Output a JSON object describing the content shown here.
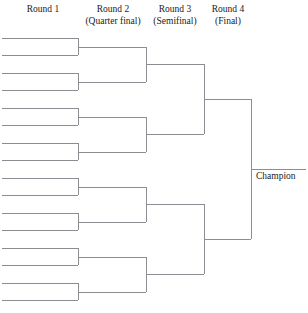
{
  "diagram": {
    "type": "tournament-bracket",
    "teams": 16,
    "rounds": 4,
    "line_color": "#8c8c92",
    "text_color": "#1a1a1a",
    "background_color": "#ffffff"
  },
  "headers": [
    {
      "id": "round-1",
      "line1": "Round 1",
      "line2": "",
      "center_x": 43,
      "top": 4
    },
    {
      "id": "round-2",
      "line1": "Round 2",
      "line2": "(Quarter final)",
      "center_x": 113,
      "top": 4
    },
    {
      "id": "round-3",
      "line1": "Round 3",
      "line2": "(Semifinal)",
      "center_x": 175,
      "top": 4
    },
    {
      "id": "round-4",
      "line1": "Round 4",
      "line2": "(Final)",
      "center_x": 228,
      "top": 4
    }
  ],
  "champion": {
    "label": "Champion",
    "x": 256,
    "y": 171
  },
  "bracket": {
    "round1": {
      "name": "Round 1",
      "slot_x_start": 2,
      "slot_x_end": 78,
      "slots_y": [
        38,
        55,
        73,
        90,
        108,
        125,
        143,
        160,
        178,
        195,
        213,
        230,
        248,
        265,
        283,
        300
      ],
      "connector_x": 78,
      "connectors": [
        {
          "top": 38,
          "bottom": 55
        },
        {
          "top": 73,
          "bottom": 90
        },
        {
          "top": 108,
          "bottom": 125
        },
        {
          "top": 143,
          "bottom": 160
        },
        {
          "top": 178,
          "bottom": 195
        },
        {
          "top": 213,
          "bottom": 230
        },
        {
          "top": 248,
          "bottom": 265
        },
        {
          "top": 283,
          "bottom": 300
        }
      ]
    },
    "round2": {
      "name": "Round 2 (Quarter final)",
      "slot_x_start": 78,
      "slot_x_end": 146,
      "slots_y": [
        47,
        82,
        117,
        152,
        187,
        222,
        257,
        292
      ],
      "connector_x": 146,
      "connectors": [
        {
          "top": 47,
          "bottom": 82
        },
        {
          "top": 117,
          "bottom": 152
        },
        {
          "top": 187,
          "bottom": 222
        },
        {
          "top": 257,
          "bottom": 292
        }
      ]
    },
    "round3": {
      "name": "Round 3 (Semifinal)",
      "slot_x_start": 146,
      "slot_x_end": 204,
      "slots_y": [
        64,
        134,
        204,
        274
      ],
      "connector_x": 204,
      "connectors": [
        {
          "top": 64,
          "bottom": 134
        },
        {
          "top": 204,
          "bottom": 274
        }
      ]
    },
    "round4": {
      "name": "Round 4 (Final)",
      "slot_x_start": 204,
      "slot_x_end": 251,
      "slots_y": [
        99,
        239
      ],
      "connector_x": 251,
      "connectors": [
        {
          "top": 99,
          "bottom": 239
        }
      ]
    },
    "champion_line": {
      "name": "Champion",
      "x_start": 251,
      "x_end": 306,
      "y": 169
    }
  }
}
